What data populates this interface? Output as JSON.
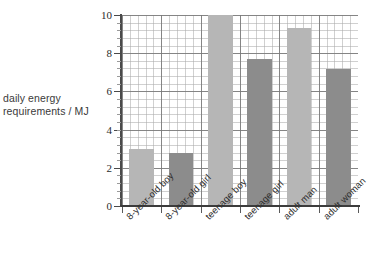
{
  "chart_data": {
    "type": "bar",
    "title": "",
    "subtitle": "",
    "xlabel": "",
    "ylabel": "daily energy requirements / MJ",
    "ylabel_lines": [
      "daily energy",
      "requirements / MJ"
    ],
    "categories": [
      "8-year-old boy",
      "8-year-old girl",
      "teenage boy",
      "teenage girl",
      "adult man",
      "adult woman"
    ],
    "values": [
      3.0,
      2.8,
      10.0,
      7.7,
      9.3,
      7.15
    ],
    "bar_colors": [
      "#b6b6b6",
      "#8c8c8c",
      "#b6b6b6",
      "#8c8c8c",
      "#b6b6b6",
      "#8c8c8c"
    ],
    "ylim": [
      0,
      10
    ],
    "yticks": [
      0,
      2,
      4,
      6,
      8,
      10
    ],
    "ytick_labels": [
      "0",
      "2",
      "4",
      "6",
      "8",
      "10"
    ],
    "y_minor_step": 0.4,
    "grid": true,
    "grid_major_color": "#787878",
    "grid_minor_color": "#aaaaaa",
    "legend": "none",
    "axis_color": "#4a4a4a",
    "background": "#ffffff"
  }
}
